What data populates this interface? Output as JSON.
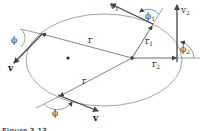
{
  "figure": {
    "caption": "Figure 3.13",
    "labels": {
      "v1": "v",
      "v1_sub": "1",
      "v2": "v",
      "v2_sub": "2",
      "phi1": "ϕ",
      "phi1_sub": "1",
      "phi2": "ϕ",
      "phi2_sub": "2",
      "r1": "r",
      "r1_sub": "1",
      "r2": "r",
      "r2_sub": "2",
      "r_upper": "r",
      "r_lower": "r",
      "phi_upper": "ϕ",
      "phi_lower": "ϕ",
      "v_upper": "v",
      "v_lower": "v"
    },
    "colors": {
      "ellipse": "#9a9a9a",
      "line": "#777777",
      "arrow": "#444444",
      "dot": "#222222"
    }
  }
}
